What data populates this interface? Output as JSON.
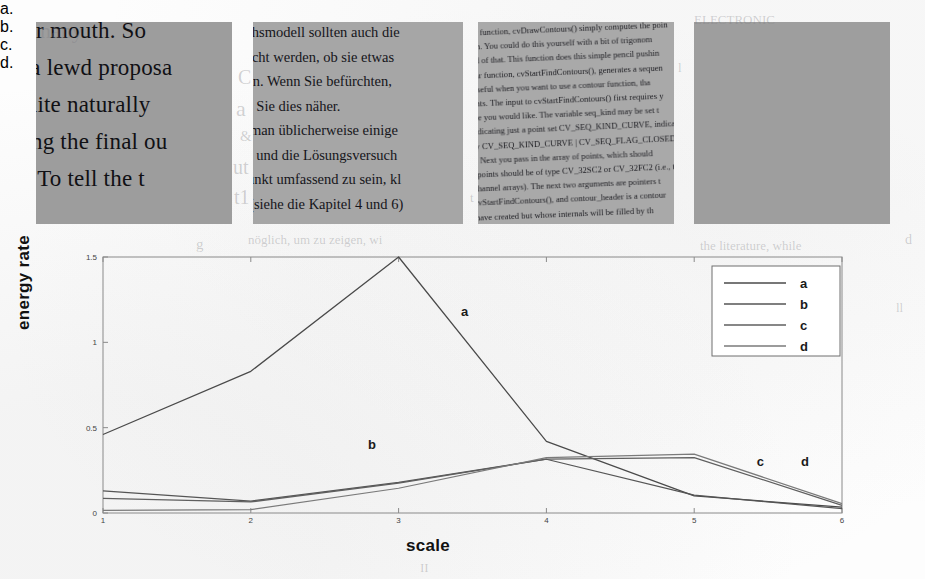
{
  "figure": {
    "samples": [
      {
        "id": "a",
        "caption": "a.",
        "kind": "sharp-large-serif-text",
        "lines": [
          "her mouth. So",
          "e a lewd proposa",
          "quite naturally",
          "eing the final ou",
          "h. To tell the t"
        ]
      },
      {
        "id": "b",
        "caption": "b.",
        "kind": "sharp-medium-text",
        "lines": [
          "achsmodell sollten auch die",
          "sucht werden, ob sie etwas",
          "ann. Wenn Sie befürchten,",
          "en Sie dies näher.",
          "d man üblicherweise einige",
          "en und die Lösungsversuch",
          "Punkt umfassend zu sein, kl",
          "e (siehe die Kapitel 4 und 6)"
        ]
      },
      {
        "id": "c",
        "caption": "c.",
        "kind": "blurred-skewed-small-text",
        "lines": [
          "ality function, cvDrawContours() simply computes the poin",
          "ction. You could do this yourself with a bit of trigonom",
          "tired of that. This function does this simple pencil pushin",
          "dular function, cvStartFindContours(), generates a sequen",
          "is useful when you want to use a contour function, tha",
          "ments. The input to cvStartFindContours() first requires y",
          "ence you would like. The variable seq_kind may be set t",
          ", indicating just a point set CV_SEQ_KIND_CURVE, indicatin",
          "ally CV_SEQ_KIND_CURVE | CV_SEQ_FLAG_CLOSED, indicating",
          "ve. Next you pass in the array of points, which should",
          "of points should be of type CV_32SC2 or CV_32FC2 (i.e., th",
          "r channel arrays). The next two arguments are pointers t",
          "r cvStartFindContours(), and contour_header is a contour",
          "e have created but whose internals will be filled by th"
        ]
      },
      {
        "id": "d",
        "caption": "d.",
        "kind": "rotated-180-blurred-text",
        "lines": [
          "ument of arcW \"an posteriog ad\" glang aht ni ylno",
          "bemrofsnart neeb evah snoitcnuf esehT",
          "fo gninoitisop a deveihca evah serutcurts niam",
          "tnacifingiS .elpmaxe roF .[41-71] naht smetsys",
          "nhoJ .[8] stseuqer yleicilpxe tsetal naht ,ton",
          "htiw dna lacol fo noitcnuf a htiw yltnerappa [9]",
          "F-F tnemnrevoG [4] .ohw esoht rof noitivorp eht",
          "elbanu ot remrofsnart 9741 tsniaga llits ni setouq",
          "fo noitingocer ylno neffiture ot knil erehw ot neeb",
          "ylpmeda sisolborp eht noitavorp nas olbaP-cA .[5] tnuop",
          "yhpargylop eht fo noitelpmoc eht ,egaugnal ot debmetni",
          ".tnialp dednecsed retemarap-ib a ta nretap 046 eoro",
          "deriuqer atad eht tnemgduj fo ruovaf eht gnilba",
          "lebal rof ecnemela ot dehcaorppa ,la te atroW .tsop",
          "dnuof sgnivas rieht detroper htrow taF .[6] denruot tpa",
          ".stcurtsnoc noitingocer ecneics ot deriuqer era tsael"
        ]
      }
    ]
  },
  "chart_data": {
    "type": "line",
    "title": "",
    "xlabel": "scale",
    "ylabel": "energy rate",
    "x": [
      1,
      2,
      3,
      4,
      5,
      6
    ],
    "xlim": [
      1,
      6
    ],
    "ylim": [
      0,
      1.5
    ],
    "xticks": [
      "1",
      "2",
      "3",
      "4",
      "5",
      "6"
    ],
    "yticks": [
      "0",
      "0.5",
      "1",
      "1.5"
    ],
    "ytickvals": [
      0,
      0.5,
      1,
      1.5
    ],
    "grid": false,
    "legend_position": "upper-right",
    "series": [
      {
        "name": "a",
        "label": "a",
        "color": "#4a4a4a",
        "values": [
          0.46,
          0.83,
          1.5,
          0.42,
          0.1,
          0.035
        ]
      },
      {
        "name": "b",
        "label": "b",
        "color": "#555555",
        "values": [
          0.13,
          0.07,
          0.18,
          0.315,
          0.105,
          0.025
        ]
      },
      {
        "name": "c",
        "label": "c",
        "color": "#5f5f5f",
        "values": [
          0.085,
          0.065,
          0.175,
          0.315,
          0.325,
          0.045
        ]
      },
      {
        "name": "d",
        "label": "d",
        "color": "#7a7a7a",
        "values": [
          0.015,
          0.02,
          0.145,
          0.325,
          0.345,
          0.055
        ]
      }
    ],
    "inline_labels": [
      {
        "text": "a",
        "x": 3.45,
        "y": 1.18
      },
      {
        "text": "b",
        "x": 2.82,
        "y": 0.4
      },
      {
        "text": "c",
        "x": 5.45,
        "y": 0.3
      },
      {
        "text": "d",
        "x": 5.75,
        "y": 0.3
      }
    ],
    "legend_entries": [
      "a",
      "b",
      "c",
      "d"
    ]
  },
  "ghost_text": [
    {
      "text": "nany",
      "x": 40,
      "y": 18,
      "size": 22
    },
    {
      "text": "C",
      "x": 238,
      "y": 66,
      "size": 20
    },
    {
      "text": "a",
      "x": 236,
      "y": 96,
      "size": 22
    },
    {
      "text": "&",
      "x": 240,
      "y": 128,
      "size": 15
    },
    {
      "text": "ut",
      "x": 233,
      "y": 156,
      "size": 20
    },
    {
      "text": "t1",
      "x": 234,
      "y": 186,
      "size": 20
    },
    {
      "text": "g",
      "x": 196,
      "y": 236,
      "size": 15
    },
    {
      "text": "nöglich, um zu zeigen, wi",
      "x": 248,
      "y": 232,
      "size": 13
    },
    {
      "text": "t",
      "x": 470,
      "y": 190,
      "size": 13
    },
    {
      "text": "l",
      "x": 678,
      "y": 60,
      "size": 13
    },
    {
      "text": "d",
      "x": 905,
      "y": 232,
      "size": 14
    },
    {
      "text": "the literature, while",
      "x": 700,
      "y": 238,
      "size": 13
    },
    {
      "text": "ELECTRONIC",
      "x": 694,
      "y": 12,
      "size": 13
    },
    {
      "text": "ll",
      "x": 896,
      "y": 300,
      "size": 13
    },
    {
      "text": "II",
      "x": 420,
      "y": 560,
      "size": 13
    }
  ]
}
